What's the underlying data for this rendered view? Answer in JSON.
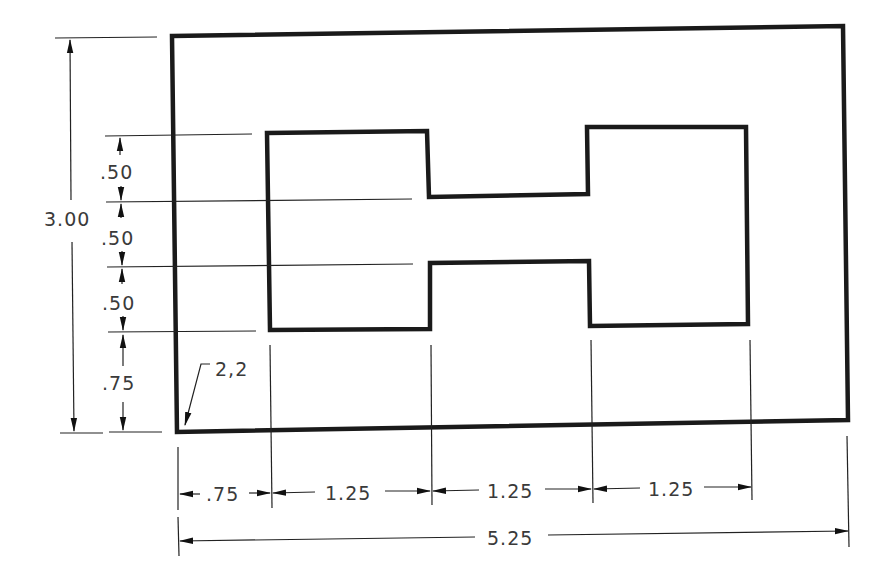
{
  "drawing": {
    "type": "dimensioned technical drawing",
    "units": "inches",
    "colors": {
      "line": "#1a1a1a",
      "text": "#3a3a3a",
      "background": "#ffffff"
    }
  },
  "labels": {
    "overall_height": "3.00",
    "dim_top_slot": ".50",
    "dim_mid_slot": ".50",
    "dim_bottom_slot": ".50",
    "dim_bottom_offset": ".75",
    "origin_note": "2,2",
    "dim_left_offset": ".75",
    "dim_width_1": "1.25",
    "dim_width_2": "1.25",
    "dim_width_3": "1.25",
    "overall_width": "5.25"
  },
  "dimensions": {
    "vertical": [
      {
        "name": "overall-height",
        "value": "3.00"
      },
      {
        "name": "top-step",
        "value": ".50"
      },
      {
        "name": "middle-slot",
        "value": ".50"
      },
      {
        "name": "lower-step",
        "value": ".50"
      },
      {
        "name": "bottom-offset",
        "value": ".75"
      }
    ],
    "horizontal": [
      {
        "name": "left-offset",
        "value": ".75"
      },
      {
        "name": "left-block-width",
        "value": "1.25"
      },
      {
        "name": "center-neck-width",
        "value": "1.25"
      },
      {
        "name": "right-block-width",
        "value": "1.25"
      },
      {
        "name": "overall-width",
        "value": "5.25"
      }
    ],
    "origin_coordinate": "2,2"
  }
}
